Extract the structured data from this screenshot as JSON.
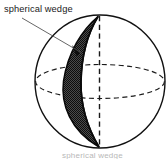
{
  "figure": {
    "background_color": "#ffffff",
    "stroke_color": "#111111",
    "wedge_fill_color": "#3d3d3d",
    "dashed_color": "#1a1a1a",
    "label": {
      "text": "spherical wedge",
      "x": 4,
      "y": 12
    },
    "caption": {
      "text": "spherical wedge",
      "visible_partial": true
    },
    "leader_line": {
      "name": "leader-line",
      "from_x": 22,
      "from_y": 18,
      "to_x": 82,
      "to_y": 53
    },
    "sphere": {
      "name": "sphere-outline",
      "center_x": 100,
      "center_y": 81.5,
      "radius_x": 65,
      "radius_y": 66.5,
      "stroke_width": 1.4
    },
    "equator": {
      "name": "equator-ellipse",
      "center_x": 100,
      "center_y": 81.5,
      "radius_x": 65,
      "radius_y": 17,
      "style": "dashed"
    },
    "polar_axis": {
      "name": "polar-axis",
      "x": 99.5,
      "top_y": 16,
      "bottom_y": 147,
      "style": "dashed"
    },
    "wedge": {
      "name": "spherical-wedge-lune",
      "top_pole_x": 98,
      "top_pole_y": 16,
      "bottom_pole_x": 99,
      "bottom_pole_y": 147,
      "max_width_x_left": 62,
      "max_width_x_right": 97,
      "fill": "stipple-dark"
    }
  }
}
